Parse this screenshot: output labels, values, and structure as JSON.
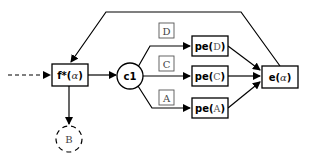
{
  "diagram": {
    "nodes": {
      "f_star": {
        "prefix": "f*(",
        "param": "α",
        "suffix": ")"
      },
      "c1": {
        "label": "c1"
      },
      "B": {
        "label": "B"
      },
      "pe_D": {
        "prefix": "pe(",
        "param": "D",
        "suffix": ")"
      },
      "pe_C": {
        "prefix": "pe(",
        "param": "C",
        "suffix": ")"
      },
      "pe_A": {
        "prefix": "pe(",
        "param": "A",
        "suffix": ")"
      },
      "e": {
        "prefix": "e(",
        "param": "α",
        "suffix": ")"
      }
    },
    "edge_labels": {
      "D": "D",
      "C": "C",
      "A": "A"
    },
    "edges": [
      {
        "from": "input",
        "to": "f_star",
        "style": "dashed"
      },
      {
        "from": "f_star",
        "to": "c1",
        "style": "solid"
      },
      {
        "from": "f_star",
        "to": "B",
        "style": "solid"
      },
      {
        "from": "c1",
        "to": "pe_D",
        "label": "D"
      },
      {
        "from": "c1",
        "to": "pe_C",
        "label": "C"
      },
      {
        "from": "c1",
        "to": "pe_A",
        "label": "A"
      },
      {
        "from": "pe_D",
        "to": "e"
      },
      {
        "from": "pe_C",
        "to": "e"
      },
      {
        "from": "pe_A",
        "to": "e"
      },
      {
        "from": "e",
        "to": "f_star",
        "style": "feedback"
      }
    ]
  }
}
